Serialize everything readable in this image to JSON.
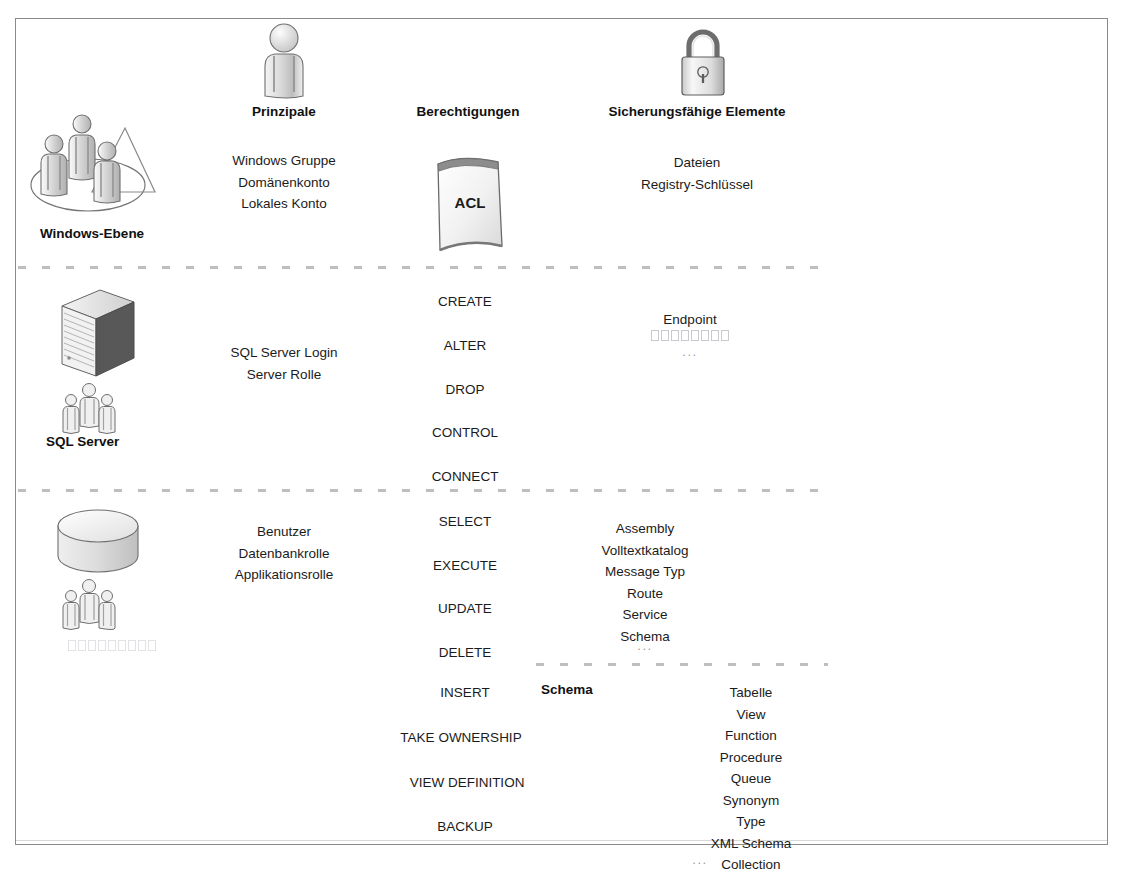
{
  "diagram": {
    "column_headers": [
      {
        "id": "principals",
        "label": "Prinzipale"
      },
      {
        "id": "permissions",
        "label": "Berechtigungen"
      },
      {
        "id": "securables",
        "label": "Sicherungsfähige Elemente"
      }
    ],
    "layers": [
      {
        "id": "windows",
        "name": "Windows-Ebene",
        "icon": "windows-users-group-icon",
        "principals": [
          "Windows Gruppe",
          "Domänenkonto",
          "Lokales Konto"
        ],
        "permissions_icon": "acl-document-icon",
        "permissions_icon_label": "ACL",
        "permissions": [],
        "securables": [
          "Dateien",
          "Registry-Schlüssel"
        ]
      },
      {
        "id": "sqlserver",
        "name": "SQL Server",
        "icon": "server-tower-icon",
        "secondary_icon": "people-group-icon",
        "principals": [
          "SQL Server Login",
          "Server Rolle"
        ],
        "permissions": [
          "CREATE",
          "ALTER",
          "DROP",
          "CONTROL",
          "CONNECT"
        ],
        "securables": [
          "Endpoint"
        ],
        "securables_unreadable_glyph_count": 8,
        "securables_ellipsis": "..."
      },
      {
        "id": "database",
        "name": "",
        "icon": "database-cylinder-icon",
        "secondary_icon": "people-group-icon",
        "principal_unreadable_glyph_count": 9,
        "principals": [
          "Benutzer",
          "Datenbankrolle",
          "Applikationsrolle"
        ],
        "permissions": [
          "SELECT",
          "EXECUTE",
          "UPDATE",
          "DELETE"
        ],
        "securables": [
          "Assembly",
          "Volltextkatalog",
          "Message Typ",
          "Route",
          "Service",
          "Schema"
        ],
        "securables_ellipsis": "..."
      },
      {
        "id": "schema",
        "name": "Schema",
        "permissions": [
          "INSERT",
          "TAKE OWNERSHIP",
          "VIEW DEFINITION",
          "BACKUP"
        ],
        "securables": [
          "Tabelle",
          "View",
          "Function",
          "Procedure",
          "Queue",
          "Synonym",
          "Type",
          "XML Schema",
          "Collection"
        ],
        "securables_ellipsis": "..."
      }
    ],
    "colors": {
      "frame": "#8a8a8a",
      "text": "#1b1b1b",
      "heading": "#111111",
      "separator": "#b9b9bf",
      "ellipsis": "#9a9a9a",
      "icon_fill": "#e8e8e8",
      "icon_stroke": "#6b6b6b"
    }
  }
}
